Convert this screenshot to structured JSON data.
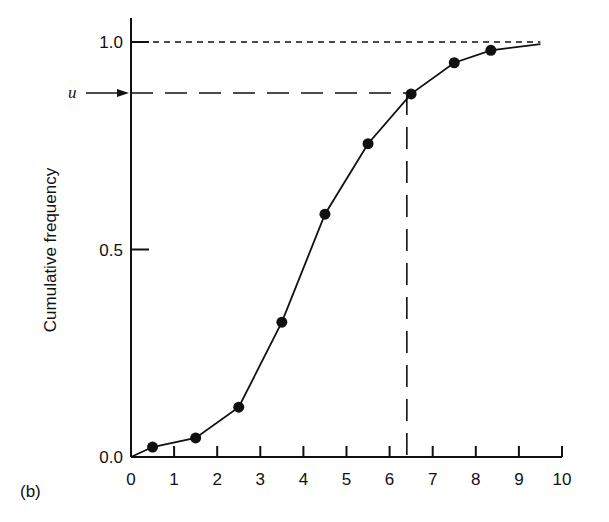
{
  "panel_label": "(b)",
  "chart_data": {
    "type": "line",
    "title": "",
    "xlabel": "",
    "ylabel": "Cumulative frequency",
    "xlim": [
      0,
      10
    ],
    "ylim": [
      0,
      1.0
    ],
    "x_ticks": [
      0,
      1,
      2,
      3,
      4,
      5,
      6,
      7,
      8,
      9,
      10
    ],
    "x_tick_labels": [
      "0",
      "1",
      "2",
      "3",
      "4",
      "5",
      "6",
      "7",
      "8",
      "9",
      "10"
    ],
    "y_ticks": [
      0.0,
      0.5,
      1.0
    ],
    "y_tick_labels": [
      "0.0",
      "0.5",
      "1.0"
    ],
    "grid": false,
    "legend": null,
    "series": [
      {
        "name": "Cumulative frequency",
        "marker": "filled-circle",
        "x": [
          0.5,
          1.5,
          2.5,
          3.5,
          4.5,
          5.5,
          6.5,
          7.5,
          8.35
        ],
        "values": [
          0.024,
          0.046,
          0.12,
          0.325,
          0.585,
          0.755,
          0.875,
          0.95,
          0.98
        ]
      }
    ],
    "line_start": [
      0,
      0
    ],
    "line_end": [
      9.5,
      0.995
    ],
    "annotations": [
      {
        "type": "horizontal-dashed-line",
        "y": 1.0,
        "label": "1.0 reference"
      },
      {
        "type": "arrow",
        "label": "u",
        "y": 0.877,
        "pointing_to": "y-axis"
      },
      {
        "type": "horizontal-dashed-line",
        "y": 0.877,
        "from_x": 0,
        "to_x": 6.4
      },
      {
        "type": "vertical-dashed-line",
        "x": 6.4,
        "from_y": 0,
        "to_y": 0.877
      }
    ]
  },
  "labels": {
    "u": "u",
    "ylabel": "Cumulative frequency"
  }
}
